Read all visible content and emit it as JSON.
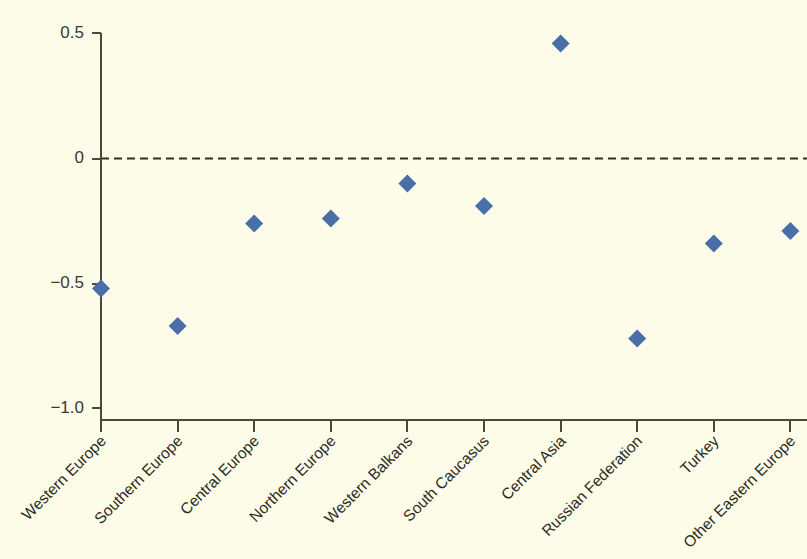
{
  "chart_data": {
    "type": "scatter",
    "title": "",
    "subtitle": "",
    "xlabel": "",
    "ylabel": "",
    "categories": [
      "Western Europe",
      "Southern Europe",
      "Central Europe",
      "Northern Europe",
      "Western Balkans",
      "South Caucasus",
      "Central Asia",
      "Russian Federation",
      "Turkey",
      "Other Eastern Europe"
    ],
    "values": [
      -0.52,
      -0.67,
      -0.26,
      -0.24,
      -0.1,
      -0.19,
      0.46,
      -0.72,
      -0.34,
      -0.29
    ],
    "series": [
      {
        "name": "value",
        "values": [
          -0.52,
          -0.67,
          -0.26,
          -0.24,
          -0.1,
          -0.19,
          0.46,
          -0.72,
          -0.34,
          -0.29
        ]
      }
    ],
    "ylim": [
      -1.0,
      0.5
    ],
    "ytick_values": [
      0.5,
      0,
      -0.5,
      -1.0
    ],
    "ytick_labels": [
      "0.5",
      "0",
      "−0.5",
      "−1.0"
    ],
    "grid": false,
    "legend": null,
    "legend_position": "none",
    "annotations": [
      {
        "kind": "reference-line",
        "axis": "y",
        "value": 0,
        "style": "dashed",
        "label": ""
      }
    ],
    "marker": {
      "shape": "diamond",
      "color": "#4a6fa8",
      "size": 9
    },
    "background_color": "#fdfce8",
    "axis_color": "#4a4a3c",
    "xtick_label_rotation": 45
  }
}
